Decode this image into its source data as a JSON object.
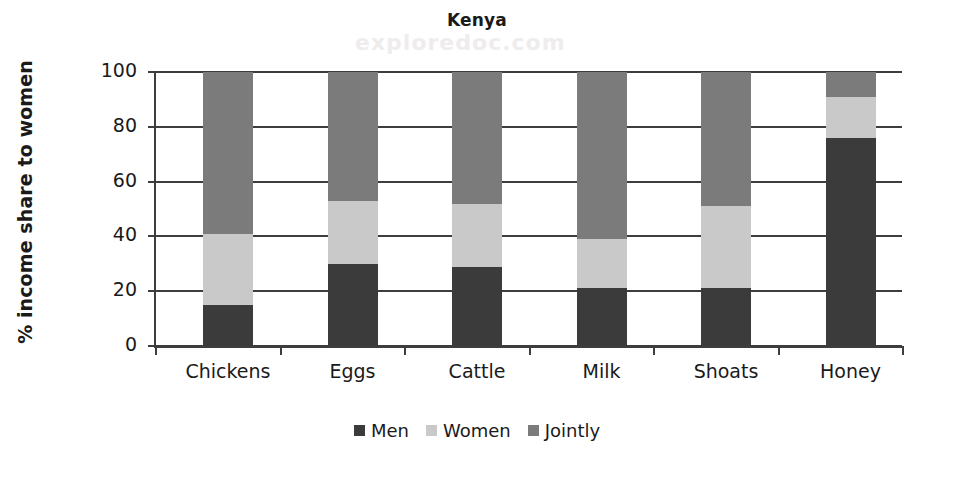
{
  "watermark": "exploredoc.com",
  "chart_data": {
    "type": "bar",
    "subtype": "stacked-100",
    "title": "Kenya",
    "xlabel": "",
    "ylabel": "% income share to women",
    "categories": [
      "Chickens",
      "Eggs",
      "Cattle",
      "Milk",
      "Shoats",
      "Honey"
    ],
    "series": [
      {
        "name": "Men",
        "color": "#3b3b3b",
        "values": [
          15,
          30,
          29,
          21,
          21,
          76
        ]
      },
      {
        "name": "Women",
        "color": "#c9c9c9",
        "values": [
          26,
          23,
          23,
          18,
          30,
          15
        ]
      },
      {
        "name": "Jointly",
        "color": "#7b7b7b",
        "values": [
          59,
          47,
          48,
          61,
          49,
          9
        ]
      }
    ],
    "ylim": [
      0,
      100
    ],
    "yticks": [
      0,
      20,
      40,
      60,
      80,
      100
    ],
    "ytick_labels": [
      "0",
      "20",
      "40",
      "60",
      "80",
      "100"
    ],
    "grid": true,
    "legend_position": "bottom"
  }
}
